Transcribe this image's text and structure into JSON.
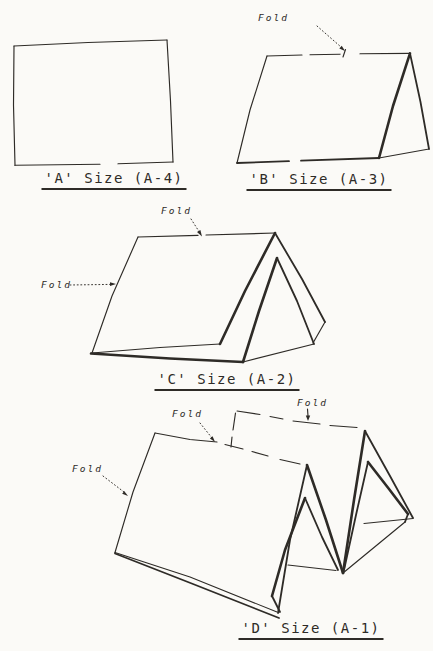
{
  "page": {
    "background": "#fbfaf7",
    "ink": "#2e2b27",
    "description_labels": {
      "fold": "Fold"
    }
  },
  "figures": [
    {
      "id": "figure-a",
      "caption": "'A' Size (A-4)",
      "fold_labels": []
    },
    {
      "id": "figure-b",
      "caption": "'B' Size (A-3)",
      "fold_labels": [
        "Fold"
      ]
    },
    {
      "id": "figure-c",
      "caption": "'C' Size (A-2)",
      "fold_labels": [
        "Fold",
        "Fold"
      ]
    },
    {
      "id": "figure-d",
      "caption": "'D' Size (A-1)",
      "fold_labels": [
        "Fold",
        "Fold",
        "Fold"
      ]
    }
  ]
}
